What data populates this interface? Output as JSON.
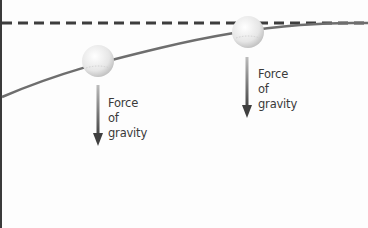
{
  "diagram": {
    "reference_line": {
      "style": "dashed",
      "color": "#3d3d3d"
    },
    "trajectory": {
      "color": "#6e6e6e"
    },
    "ball_color": "#eeeeee",
    "arrow_color": "#555555",
    "labels": [
      {
        "line1": "Force",
        "line2": "of",
        "line3": "gravity"
      },
      {
        "line1": "Force",
        "line2": "of",
        "line3": "gravity"
      }
    ]
  }
}
